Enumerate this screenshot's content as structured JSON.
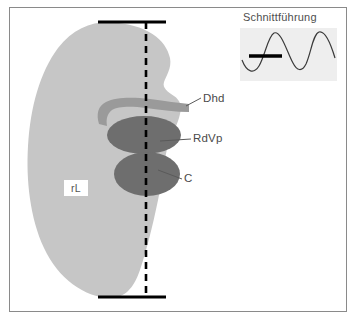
{
  "figure": {
    "type": "anatomical-schematic",
    "language": "de",
    "frame": {
      "border_color": "#8a8a8a",
      "background": "#ffffff"
    }
  },
  "organ": {
    "name": "rL",
    "label": "rL",
    "full_hint": "rechte Leber",
    "fill_color": "#c6c6c6"
  },
  "structures": [
    {
      "key": "dhd",
      "label": "Dhd",
      "shape": "curved-band",
      "fill_color": "#9a9a9a"
    },
    {
      "key": "rdvp",
      "label": "RdVp",
      "shape": "ellipse",
      "fill_color": "#6e6e6e"
    },
    {
      "key": "c",
      "label": "C",
      "shape": "ellipse",
      "fill_color": "#6e6e6e"
    }
  ],
  "labels": {
    "dhd": "Dhd",
    "rdvp": "RdVp",
    "c": "C",
    "rl": "rL"
  },
  "scan_plane": {
    "line_style": "dashed",
    "color": "#000000",
    "end_marker_color": "#000000",
    "name": "section-plane-line"
  },
  "inset": {
    "title": "Schnittführung",
    "background": "#eeeeee",
    "curve_color": "#3a3a3a",
    "marker_color": "#000000"
  },
  "colors": {
    "organ_gray": "#c6c6c6",
    "band_gray": "#9a9a9a",
    "structure_gray": "#6e6e6e",
    "line_black": "#000000",
    "frame_gray": "#8a8a8a",
    "text_gray": "#4a4a4a",
    "inset_bg": "#eeeeee"
  }
}
